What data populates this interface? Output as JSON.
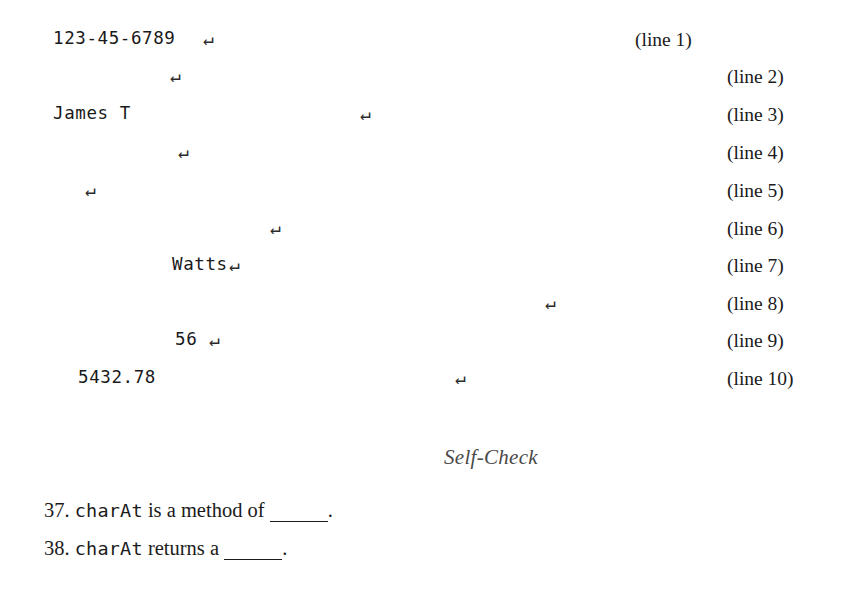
{
  "document": {
    "listing": {
      "rows": [
        {
          "text": "123-45-6789",
          "text_x": 53,
          "return_x": 203,
          "label": "(line 1)",
          "label_x": 635,
          "y": 30
        },
        {
          "text": "",
          "text_x": 53,
          "return_x": 170,
          "label": "(line 2)",
          "label_x": 727,
          "y": 67
        },
        {
          "text": "James T",
          "text_x": 53,
          "return_x": 360,
          "label": "(line 3)",
          "label_x": 727,
          "y": 105
        },
        {
          "text": "",
          "text_x": 53,
          "return_x": 178,
          "label": "(line 4)",
          "label_x": 727,
          "y": 143
        },
        {
          "text": "",
          "text_x": 53,
          "return_x": 85,
          "label": "(line 5)",
          "label_x": 727,
          "y": 181
        },
        {
          "text": "",
          "text_x": 53,
          "return_x": 270,
          "label": "(line 6)",
          "label_x": 727,
          "y": 219
        },
        {
          "text": "Watts",
          "text_x": 172,
          "return_x": 229,
          "label": "(line 7)",
          "label_x": 727,
          "y": 256
        },
        {
          "text": "",
          "text_x": 53,
          "return_x": 545,
          "label": "(line 8)",
          "label_x": 727,
          "y": 294
        },
        {
          "text": "56",
          "text_x": 175,
          "return_x": 209,
          "label": "(line 9)",
          "label_x": 727,
          "y": 331
        },
        {
          "text": "5432.78",
          "text_x": 78,
          "return_x": 455,
          "label": "(line 10)",
          "label_x": 727,
          "y": 369
        }
      ],
      "return_glyph": "↵"
    },
    "section_heading": {
      "label": "Self-Check",
      "x": 444,
      "y": 447
    },
    "questions": [
      {
        "number": "37.",
        "code": "charAt",
        "text_before_blank": " is a method of ",
        "blank_width": 58,
        "text_after_blank": ".",
        "x": 44,
        "y": 500
      },
      {
        "number": "38.",
        "code": "charAt",
        "text_before_blank": " returns a ",
        "blank_width": 58,
        "text_after_blank": ".",
        "x": 44,
        "y": 538
      }
    ],
    "colors": {
      "page_background": "#ffffff",
      "body_text": "#1b1b1b",
      "heading_text": "#4a4a4a",
      "code_text": "#1a1a1a"
    }
  }
}
